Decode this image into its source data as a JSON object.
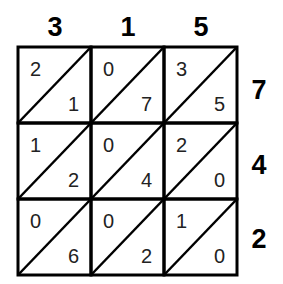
{
  "top_digits": [
    "3",
    "1",
    "5"
  ],
  "side_digits": [
    "7",
    "4",
    "2"
  ],
  "cells": [
    [
      {
        "tens": "2",
        "ones": "1"
      },
      {
        "tens": "0",
        "ones": "7"
      },
      {
        "tens": "3",
        "ones": "5"
      }
    ],
    [
      {
        "tens": "1",
        "ones": "2"
      },
      {
        "tens": "0",
        "ones": "4"
      },
      {
        "tens": "2",
        "ones": "0"
      }
    ],
    [
      {
        "tens": "0",
        "ones": "6"
      },
      {
        "tens": "0",
        "ones": "2"
      },
      {
        "tens": "1",
        "ones": "0"
      }
    ]
  ],
  "colors": {
    "line": "#000000",
    "text": "#222222"
  }
}
